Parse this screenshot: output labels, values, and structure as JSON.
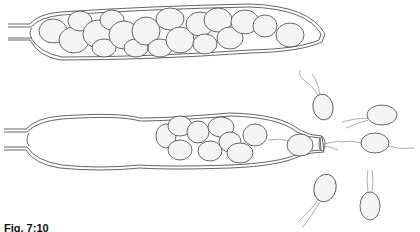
{
  "figure": {
    "caption": "Fig. 7:10",
    "panels": [
      {
        "name": "upper-sporangium",
        "state": "mature, packed with spores"
      },
      {
        "name": "lower-sporangium",
        "state": "discharging spores through tip"
      },
      {
        "name": "released-zoospores",
        "count": 6,
        "flagella_per_spore": 2
      }
    ],
    "colors": {
      "line": "#444444",
      "spore_fill": "#f4f4f4",
      "background": "#ffffff"
    }
  }
}
